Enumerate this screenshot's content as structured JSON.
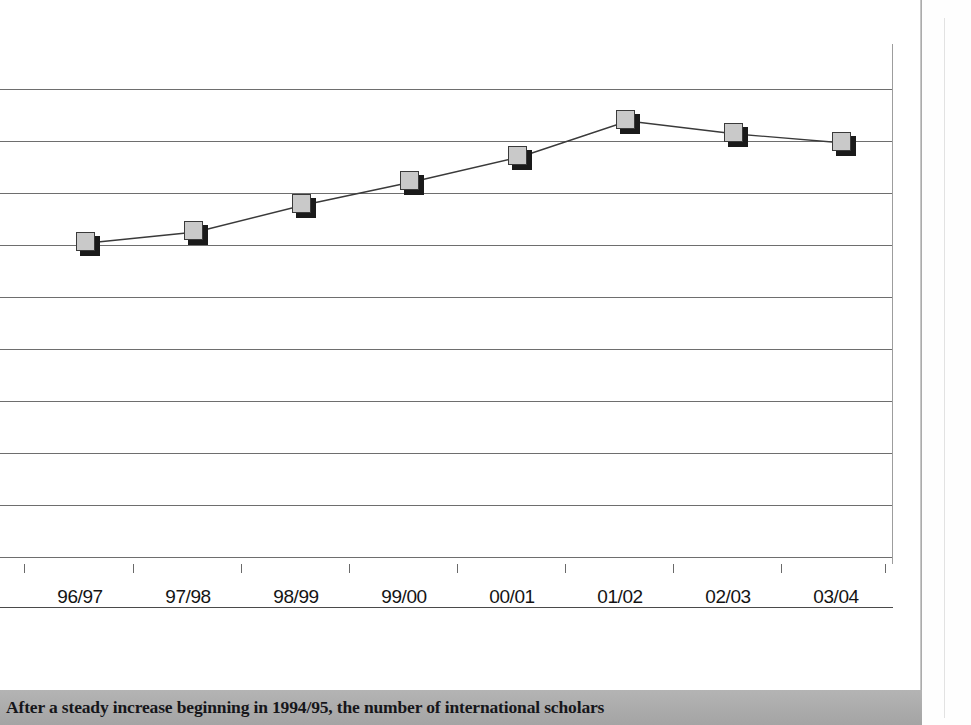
{
  "figure": {
    "caption": "After a steady increase beginning in 1994/95, the number of international scholars",
    "caption_bar_color": "#ababab",
    "marker_fill_color": "#c9c9c9",
    "marker_shadow_color": "#1a1a1a",
    "line_color": "#3a3a3a",
    "grid_color": "#6e6e6e"
  },
  "chart_data": {
    "type": "line",
    "title": "",
    "subtitle": "",
    "xlabel": "",
    "ylabel": "",
    "grid": "horizontal",
    "legend": "none",
    "categories": [
      "96/97",
      "97/98",
      "98/99",
      "99/00",
      "00/01",
      "01/02",
      "02/03",
      "03/04"
    ],
    "values": [
      3.05,
      3.45,
      4.05,
      4.45,
      5.05,
      5.85,
      5.6,
      5.4
    ],
    "ylim": [
      0,
      10
    ],
    "ytick_count": 11,
    "axis_note": "y-axis tick labels are cropped out of this view; values estimated from the 11 horizontal gridlines",
    "points": [
      {
        "x_label": "96/97",
        "px_x": 88,
        "px_y": 243
      },
      {
        "x_label": "97/98",
        "px_x": 196,
        "px_y": 232
      },
      {
        "x_label": "98/99",
        "px_x": 304,
        "px_y": 205
      },
      {
        "x_label": "99/00",
        "px_x": 412,
        "px_y": 182
      },
      {
        "x_label": "00/01",
        "px_x": 520,
        "px_y": 157
      },
      {
        "x_label": "01/02",
        "px_x": 628,
        "px_y": 121
      },
      {
        "x_label": "02/03",
        "px_x": 736,
        "px_y": 134
      },
      {
        "x_label": "03/04",
        "px_x": 844,
        "px_y": 143
      }
    ],
    "gridline_px_y": [
      45,
      97,
      149,
      201,
      253,
      305,
      357,
      409,
      461,
      513,
      563
    ],
    "xtick_px": [
      32,
      141,
      249,
      357,
      465,
      573,
      681,
      789,
      893
    ],
    "xlabel_px": [
      88,
      196,
      304,
      412,
      520,
      628,
      736,
      844
    ]
  }
}
